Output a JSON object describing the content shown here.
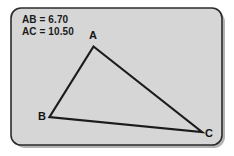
{
  "figure": {
    "panel": {
      "fill": "#d6d6d6",
      "border_color": "#2b2b2b",
      "shadow_color": "#9a9a9a",
      "corner_radius": 10
    },
    "canvas": {
      "background": "#ffffff",
      "width": 234,
      "height": 156
    }
  },
  "measurements": [
    {
      "id": "AB",
      "label": "AB = 6.70",
      "segment": "AB",
      "value": 6.7
    },
    {
      "id": "AC",
      "label": "AC = 10.50",
      "segment": "AC",
      "value": 10.5
    }
  ],
  "measurement_lines": {
    "line1": "AB = 6.70",
    "line2": "AC = 10.50"
  },
  "triangle": {
    "stroke_color": "#1b1b1b",
    "stroke_width": 2.2,
    "fill": "none",
    "vertices": [
      {
        "name": "A",
        "label": "A",
        "x": 93.5,
        "y": 46.5,
        "label_x": 93,
        "label_y": 39
      },
      {
        "name": "B",
        "label": "B",
        "x": 49.5,
        "y": 117.0,
        "label_x": 42,
        "label_y": 120
      },
      {
        "name": "C",
        "label": "C",
        "x": 202.0,
        "y": 132.0,
        "label_x": 209,
        "label_y": 137
      }
    ],
    "edges": [
      {
        "id": "AB",
        "from": "A",
        "to": "B"
      },
      {
        "id": "AC",
        "from": "A",
        "to": "C"
      },
      {
        "id": "BC",
        "from": "B",
        "to": "C"
      }
    ],
    "path": "M 93.5 46.5 L 49.5 117 L 202 132 Z"
  }
}
